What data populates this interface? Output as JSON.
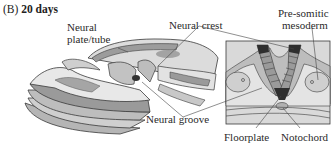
{
  "figure": {
    "panel_letter": "(B)",
    "stage": "20 days",
    "labels": {
      "neural_plate_line1": "Neural",
      "neural_plate_line2": "plate/tube",
      "neural_crest": "Neural crest",
      "presomitic_line1": "Pre-somitic",
      "presomitic_line2": "mesoderm",
      "neural_groove": "Neural groove",
      "floorplate": "Floorplate",
      "notochord": "Notochord"
    },
    "colors": {
      "outline": "#3a3a3a",
      "light_fill": "#e6e6e6",
      "mid_fill": "#a8a8a8",
      "dark_fill": "#333333",
      "inset_bg": "#d9d9d9"
    }
  }
}
